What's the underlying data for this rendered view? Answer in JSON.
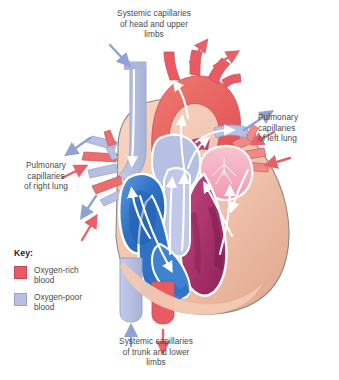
{
  "figure": {
    "type": "anatomical-diagram",
    "background": "#ffffff"
  },
  "labels": {
    "top": "Systemic capillaries\nof head and upper\nlimbs",
    "right": "Pulmonary\ncapillaries\nof left lung",
    "left": "Pulmonary\ncapillaries\nof right lung",
    "bottom": "Systemic capillaries\nof trunk and lower\nlimbs"
  },
  "key": {
    "title": "Key:",
    "items": [
      {
        "label": "Oxygen-rich\nblood",
        "color": "#ea5a62"
      },
      {
        "label": "Oxygen-poor\nblood",
        "color": "#b6c0e2"
      }
    ]
  },
  "colors": {
    "oxygen_rich": "#ea5a62",
    "oxygen_poor": "#b6c0e2",
    "vein_blue_deep": "#2f72c4",
    "vein_blue_mid": "#4a8ed6",
    "left_chamber_magenta": "#a8316b",
    "left_chamber_pink": "#f0a8bc",
    "myocardium": "#efbfa8",
    "myocardium_shadow": "#d99f86",
    "outline": "#8a8a8a",
    "flow_arrow": "#ffffff",
    "text": "#4a4a4a"
  },
  "flow_arrows": {
    "top_in": "oxygen-poor blood entering from head and upper limbs",
    "top_out": "oxygen-rich blood leaving to head and upper limbs",
    "right_out": "oxygen-poor blood leaving to left lung",
    "right_in": "oxygen-rich blood returning from left lung",
    "left_out": "oxygen-poor blood leaving to right lung",
    "left_in": "oxygen-rich blood returning from right lung",
    "bottom_in": "oxygen-poor blood entering from trunk and lower limbs",
    "bottom_out": "oxygen-rich blood leaving to trunk and lower limbs"
  }
}
